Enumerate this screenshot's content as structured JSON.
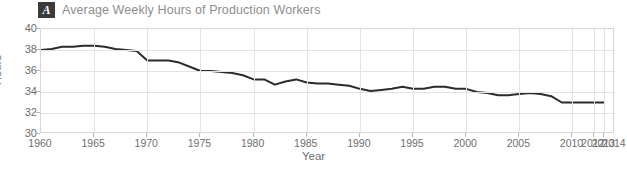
{
  "panel": {
    "badge_label": "A",
    "title": "Average Weekly Hours of Production Workers"
  },
  "axis": {
    "ylabel": "Hours",
    "xlabel": "Year"
  },
  "colors": {
    "line": "#2b2b2b",
    "grid": "#e3e3e3",
    "frame": "#d7d7d7",
    "text": "#6e6e6e",
    "title_text": "#8d8d8d",
    "badge_bg": "#3b3b3b",
    "badge_text": "#ffffff"
  },
  "chart_data": {
    "type": "line",
    "title": "Average Weekly Hours of Production Workers",
    "xlabel": "Year",
    "ylabel": "Hours",
    "xlim": [
      1960,
      2014
    ],
    "ylim": [
      30,
      40
    ],
    "ytick_labels": [
      "40",
      "38",
      "36",
      "34",
      "32",
      "30"
    ],
    "yticks": [
      40,
      38,
      36,
      34,
      32,
      30
    ],
    "xtick_labels": [
      "1960",
      "1965",
      "1970",
      "1975",
      "1980",
      "1985",
      "1990",
      "1995",
      "2000",
      "2005",
      "2010",
      "2012",
      "2013",
      "2014"
    ],
    "xticks": [
      1960,
      1965,
      1970,
      1975,
      1980,
      1985,
      1990,
      1995,
      2000,
      2005,
      2010,
      2012,
      2013,
      2014
    ],
    "grid": true,
    "legend": "none",
    "series": [
      {
        "name": "Average weekly hours",
        "x": [
          1960,
          1961,
          1962,
          1963,
          1964,
          1965,
          1966,
          1967,
          1968,
          1969,
          1970,
          1971,
          1972,
          1973,
          1974,
          1975,
          1976,
          1977,
          1978,
          1979,
          1980,
          1981,
          1982,
          1983,
          1984,
          1985,
          1986,
          1987,
          1988,
          1989,
          1990,
          1991,
          1992,
          1993,
          1994,
          1995,
          1996,
          1997,
          1998,
          1999,
          2000,
          2001,
          2002,
          2003,
          2004,
          2005,
          2006,
          2007,
          2008,
          2009,
          2010,
          2011,
          2012,
          2013
        ],
        "y": [
          38.0,
          38.1,
          38.3,
          38.3,
          38.4,
          38.4,
          38.3,
          38.1,
          38.0,
          37.9,
          37.0,
          37.0,
          37.0,
          36.8,
          36.4,
          36.0,
          36.0,
          35.9,
          35.8,
          35.6,
          35.2,
          35.2,
          34.7,
          35.0,
          35.2,
          34.9,
          34.8,
          34.8,
          34.7,
          34.6,
          34.3,
          34.1,
          34.2,
          34.3,
          34.5,
          34.3,
          34.3,
          34.5,
          34.5,
          34.3,
          34.3,
          34.0,
          33.9,
          33.7,
          33.7,
          33.8,
          33.9,
          33.8,
          33.6,
          33.0,
          33.0,
          33.0,
          33.0,
          33.0
        ]
      }
    ]
  }
}
